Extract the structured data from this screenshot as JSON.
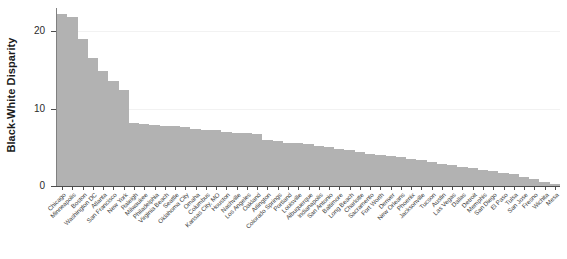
{
  "chart_data": {
    "type": "bar",
    "title": "",
    "subtitle": "",
    "xlabel": "",
    "ylabel": "Black-White Disparity",
    "ylim": [
      0,
      23
    ],
    "yticks": [
      0,
      10,
      20
    ],
    "ytick_labels": [
      "0",
      "10",
      "20"
    ],
    "gridlines": [
      10,
      20
    ],
    "legend": null,
    "legend_position": "none",
    "orientation": "vertical",
    "sorted": "descending",
    "bar_color": "#b2b2b2",
    "categories": [
      "Chicago",
      "Minneapolis",
      "Boston",
      "Washington DC",
      "Atlanta",
      "San Francisco",
      "New York",
      "Raleigh",
      "Milwaukee",
      "Philadelphia",
      "Virginia Beach",
      "Seattle",
      "Oklahoma City",
      "Omaha",
      "Columbus",
      "Kansas City, MO",
      "Houston",
      "Nashville",
      "Los Angeles",
      "Oakland",
      "Arlington",
      "Colorado Springs",
      "Portland",
      "Louisville",
      "Albuquerque",
      "Indianapolis",
      "San Antonio",
      "Baltimore",
      "Long Beach",
      "Charlotte",
      "Sacramento",
      "Fort Worth",
      "Denver",
      "New Orleans",
      "Phoenix",
      "Jacksonville",
      "Tucson",
      "Austin",
      "Las Vegas",
      "Dallas",
      "Detroit",
      "Memphis",
      "San Diego",
      "El Paso",
      "Tulsa",
      "San Jose",
      "Fresno",
      "Wichita",
      "Mesa"
    ],
    "values": [
      22.2,
      21.8,
      19.0,
      16.6,
      14.8,
      13.6,
      12.4,
      8.2,
      8.0,
      7.9,
      7.8,
      7.7,
      7.6,
      7.4,
      7.3,
      7.2,
      7.0,
      6.9,
      6.8,
      6.7,
      6.0,
      5.8,
      5.6,
      5.5,
      5.4,
      5.2,
      5.0,
      4.8,
      4.6,
      4.4,
      4.2,
      4.0,
      3.9,
      3.7,
      3.5,
      3.3,
      3.1,
      2.9,
      2.7,
      2.5,
      2.3,
      2.1,
      1.9,
      1.7,
      1.5,
      1.2,
      0.9,
      0.5,
      0.2
    ]
  }
}
